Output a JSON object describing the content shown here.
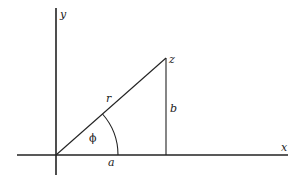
{
  "diagram": {
    "colors": {
      "line": "#222222",
      "background": "#ffffff"
    },
    "axes": {
      "x_label": "x",
      "y_label": "y"
    },
    "point_label": "z",
    "segments": {
      "hypotenuse_label": "r",
      "vertical_label": "b",
      "horizontal_label": "a"
    },
    "angle_label": "ϕ"
  }
}
